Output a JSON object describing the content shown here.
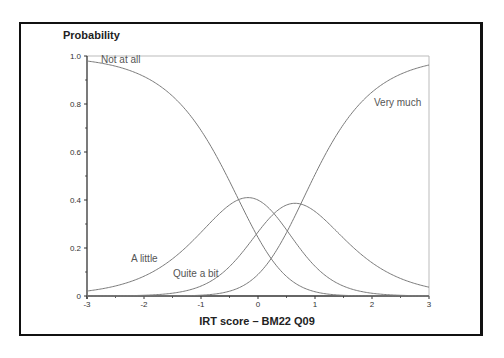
{
  "chart_data": {
    "type": "line",
    "title": "",
    "xlabel": "IRT score – BM22 Q09",
    "ylabel": "Probability",
    "xlim": [
      -3,
      3
    ],
    "ylim": [
      0,
      1.0
    ],
    "x_ticks": [
      -3,
      -2,
      -1,
      0,
      1,
      2,
      3
    ],
    "x_tick_labels": [
      "-3",
      "-2",
      "-1",
      "0",
      "1",
      "2",
      "3"
    ],
    "y_ticks": [
      0,
      0.2,
      0.4,
      0.6,
      0.8,
      1.0
    ],
    "y_tick_labels": [
      "0",
      "0.2",
      "0.4",
      "0.6",
      "0.8",
      "1.0"
    ],
    "grid": false,
    "legend": "inline curve labels",
    "model": {
      "slope": 1.45,
      "steps": [
        -0.34,
        0.28,
        0.75
      ]
    },
    "x": [
      -3,
      -2.5,
      -2,
      -1.5,
      -1,
      -0.5,
      0,
      0.5,
      1,
      1.5,
      2,
      2.5,
      3
    ],
    "series": [
      {
        "name": "Not at all",
        "values": [
          0.975,
          0.95,
          0.9,
          0.8,
          0.64,
          0.44,
          0.25,
          0.12,
          0.05,
          0.02,
          0.01,
          0.0,
          0.0
        ]
      },
      {
        "name": "A little",
        "values": [
          0.025,
          0.05,
          0.09,
          0.16,
          0.26,
          0.37,
          0.41,
          0.31,
          0.18,
          0.08,
          0.03,
          0.01,
          0.0
        ]
      },
      {
        "name": "Quite a bit",
        "values": [
          0.0,
          0.0,
          0.01,
          0.03,
          0.08,
          0.17,
          0.3,
          0.39,
          0.34,
          0.23,
          0.13,
          0.07,
          0.03
        ]
      },
      {
        "name": "Very much",
        "values": [
          0.0,
          0.0,
          0.0,
          0.0,
          0.01,
          0.03,
          0.08,
          0.19,
          0.43,
          0.67,
          0.84,
          0.93,
          0.97
        ]
      }
    ]
  },
  "labels": {
    "y_axis_title": "Probability",
    "x_axis_title": "IRT score – BM22 Q09",
    "curve_not_at_all": "Not at all",
    "curve_a_little": "A little",
    "curve_quite_a_bit": "Quite a bit",
    "curve_very_much": "Very much"
  },
  "colors": {
    "frame": "#111111",
    "axis": "#333333",
    "curve": "#7a7a7a",
    "plot_border": "#bbbbbb"
  }
}
